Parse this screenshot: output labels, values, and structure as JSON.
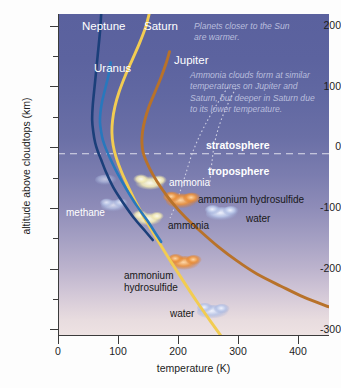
{
  "chart_data": {
    "type": "line",
    "title": "",
    "xlabel": "temperature (K)",
    "ylabel": "altitude above cloudtops (km)",
    "xlim": [
      0,
      452
    ],
    "ylim": [
      -300,
      230
    ],
    "xticks": [
      0,
      100,
      200,
      300,
      400
    ],
    "yticks": [
      200,
      100,
      0,
      -100,
      -200,
      -300
    ],
    "yticks_minor": [
      150,
      50,
      -50,
      -150,
      -250
    ],
    "grid": false,
    "legend_position": "inline-curve-labels",
    "reference_lines": [
      {
        "name": "cloudtops",
        "axis": "y",
        "value": 0,
        "style": "dashed",
        "color": "#e8e8f2"
      }
    ],
    "series": [
      {
        "name": "Neptune",
        "color": "#1b3f7a",
        "points": [
          [
            72,
            230
          ],
          [
            70,
            200
          ],
          [
            66,
            160
          ],
          [
            62,
            120
          ],
          [
            58,
            80
          ],
          [
            57,
            55
          ],
          [
            59,
            35
          ],
          [
            62,
            18
          ],
          [
            66,
            5
          ],
          [
            72,
            -10
          ],
          [
            80,
            -30
          ],
          [
            92,
            -55
          ],
          [
            108,
            -80
          ],
          [
            126,
            -105
          ],
          [
            146,
            -128
          ],
          [
            158,
            -142
          ]
        ]
      },
      {
        "name": "Uranus",
        "color": "#2878bd",
        "points": [
          [
            88,
            150
          ],
          [
            84,
            128
          ],
          [
            79,
            108
          ],
          [
            74,
            88
          ],
          [
            71,
            70
          ],
          [
            70,
            52
          ],
          [
            72,
            36
          ],
          [
            75,
            22
          ],
          [
            80,
            8
          ],
          [
            88,
            -10
          ],
          [
            99,
            -32
          ],
          [
            114,
            -58
          ],
          [
            131,
            -85
          ],
          [
            149,
            -110
          ],
          [
            164,
            -133
          ],
          [
            172,
            -145
          ]
        ]
      },
      {
        "name": "Saturn",
        "color": "#f2cc52",
        "points": [
          [
            152,
            230
          ],
          [
            146,
            208
          ],
          [
            136,
            182
          ],
          [
            124,
            155
          ],
          [
            112,
            128
          ],
          [
            102,
            102
          ],
          [
            95,
            78
          ],
          [
            91,
            55
          ],
          [
            90,
            34
          ],
          [
            92,
            14
          ],
          [
            97,
            -6
          ],
          [
            106,
            -30
          ],
          [
            118,
            -56
          ],
          [
            132,
            -84
          ],
          [
            148,
            -112
          ],
          [
            166,
            -142
          ],
          [
            186,
            -174
          ],
          [
            208,
            -208
          ],
          [
            232,
            -244
          ],
          [
            256,
            -278
          ],
          [
            272,
            -300
          ]
        ]
      },
      {
        "name": "Jupiter",
        "color": "#b8722a",
        "points": [
          [
            186,
            168
          ],
          [
            180,
            148
          ],
          [
            172,
            126
          ],
          [
            162,
            102
          ],
          [
            152,
            78
          ],
          [
            145,
            56
          ],
          [
            141,
            36
          ],
          [
            140,
            18
          ],
          [
            142,
            2
          ],
          [
            148,
            -14
          ],
          [
            158,
            -34
          ],
          [
            172,
            -56
          ],
          [
            190,
            -80
          ],
          [
            212,
            -104
          ],
          [
            238,
            -128
          ],
          [
            266,
            -152
          ],
          [
            298,
            -176
          ],
          [
            332,
            -198
          ],
          [
            372,
            -218
          ],
          [
            410,
            -236
          ],
          [
            452,
            -252
          ]
        ]
      }
    ],
    "leader_lines": [
      {
        "name": "jupiter-ammonia-pointer",
        "style": "dotted",
        "color": "#e4e4f0"
      },
      {
        "name": "saturn-ammonia-pointer",
        "style": "dotted",
        "color": "#e4e4f0"
      }
    ]
  },
  "planet_labels": [
    {
      "name": "Neptune",
      "text": "Neptune"
    },
    {
      "name": "Saturn",
      "text": "Saturn"
    },
    {
      "name": "Jupiter",
      "text": "Jupiter"
    },
    {
      "name": "Uranus",
      "text": "Uranus"
    }
  ],
  "atmosphere_layers": [
    {
      "name": "stratosphere",
      "text": "stratosphere"
    },
    {
      "name": "troposphere",
      "text": "troposphere"
    }
  ],
  "annotations": [
    {
      "name": "sun-warmth-note",
      "text": "Planets closer to the Sun are warmer."
    },
    {
      "name": "ammonia-cloud-note",
      "text": "Ammonia clouds form at similar temperatures on Jupiter and Saturn, but deeper in Saturn due to its lower temperature."
    }
  ],
  "cloud_labels": [
    {
      "name": "methane-cloud",
      "text": "methane",
      "planet": "Uranus/Neptune",
      "altitude_km": -88,
      "temperature_k": 96
    },
    {
      "name": "jupiter-ammonia-cloud",
      "text": "ammonia",
      "planet": "Jupiter",
      "altitude_km": -48,
      "temperature_k": 150
    },
    {
      "name": "jupiter-ammonium-hydrosulfide",
      "text": "ammonium hydrosulfide",
      "planet": "Jupiter",
      "altitude_km": -78,
      "temperature_k": 205
    },
    {
      "name": "jupiter-water-cloud",
      "text": "water",
      "planet": "Jupiter",
      "altitude_km": -100,
      "temperature_k": 272
    },
    {
      "name": "saturn-ammonia-cloud",
      "text": "ammonia",
      "planet": "Saturn",
      "altitude_km": -108,
      "temperature_k": 140
    },
    {
      "name": "saturn-ammonium-hydrosulfide",
      "text": "ammonium hydrosulfide",
      "planet": "Saturn",
      "altitude_km": -182,
      "temperature_k": 205
    },
    {
      "name": "saturn-water-cloud",
      "text": "water",
      "planet": "Saturn",
      "altitude_km": -262,
      "temperature_k": 250
    }
  ],
  "axis": {
    "x_title": "temperature (K)",
    "y_title": "altitude above cloudtops (km)",
    "x_tick_labels": [
      "0",
      "100",
      "200",
      "300",
      "400"
    ],
    "y_tick_labels": [
      "200",
      "100",
      "0",
      "-100",
      "-200",
      "-300"
    ]
  },
  "colors": {
    "neptune": "#1b3f7a",
    "uranus": "#2878bd",
    "saturn": "#f2cc52",
    "jupiter": "#b8722a",
    "ammonia_cloud": "#f6efc0",
    "ammonium_hydrosulfide_cloud": "#e8913f",
    "water_cloud": "#b9c4e6",
    "background_top": "#5a619e",
    "background_bottom": "#eee3e3",
    "note_text": "#b9bedd"
  }
}
